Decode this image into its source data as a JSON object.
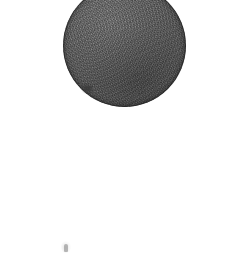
{
  "image": {
    "title": "Scanned dark circular disk on white background",
    "width_px": 247,
    "height_px": 258,
    "background_color": "#ffffff",
    "alt_text": "A large grainy dark-gray circle near the top of a white page, with a tiny faint gray smudge near the bottom-left"
  },
  "objects": {
    "disk": {
      "name": "circular disk",
      "shape": "circle",
      "fill_color": "#5d5d5d",
      "rim_color": "#1e1e1e",
      "texture": "grainy-noise",
      "center_x_px": 124,
      "center_y_px": 45,
      "diameter_px": 123,
      "clipped_edge": "top",
      "visible_bounds": {
        "left_px": 63,
        "top_px": 0,
        "right_px": 186,
        "bottom_px": 106
      }
    },
    "rim_nick": {
      "name": "dark nick on lower-left rim",
      "color": "#3b3b3b",
      "x_px": 83,
      "y_px": 101
    },
    "smudge": {
      "name": "faint gray smudge",
      "color": "#9e9e9e",
      "x_px": 64,
      "y_px": 244,
      "width_px": 4,
      "height_px": 8,
      "opacity": 0.72
    }
  }
}
